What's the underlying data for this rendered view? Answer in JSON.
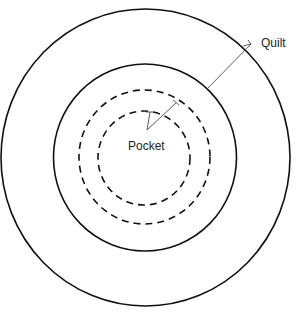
{
  "diagram": {
    "title": "",
    "colors": {
      "background": "#ffffff",
      "stroke": "#111111",
      "text": "#222222"
    },
    "labels": {
      "quilt": "Quilt",
      "pocket": "Pocket"
    },
    "rings": [
      {
        "name": "outer-quilt-boundary",
        "style": "solid"
      },
      {
        "name": "inner-quilt-boundary",
        "style": "solid"
      },
      {
        "name": "outer-pocket-boundary",
        "style": "dashed"
      },
      {
        "name": "inner-pocket-boundary",
        "style": "dashed"
      }
    ]
  }
}
